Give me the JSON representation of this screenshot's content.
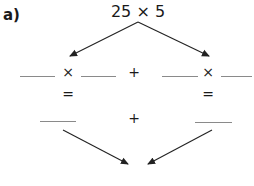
{
  "question": {
    "label": "a)",
    "expression": "25 × 5"
  },
  "row1": {
    "left_operator": "×",
    "middle_operator": "+",
    "right_operator": "×",
    "blanks": [
      "",
      "",
      "",
      ""
    ]
  },
  "equals": {
    "left": "=",
    "right": "="
  },
  "row2": {
    "middle_operator": "+",
    "blanks": [
      "",
      ""
    ]
  },
  "answer": {
    "value": ""
  },
  "colors": {
    "text": "#1a1a1a",
    "blank_line": "#8a8a8a",
    "arrow": "#222222"
  }
}
